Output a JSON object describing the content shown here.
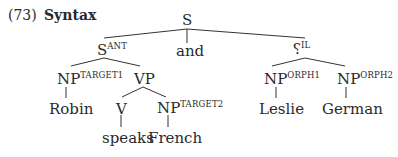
{
  "example": {
    "number": "(73)",
    "title": "Syntax"
  },
  "tree": {
    "root": {
      "label": "S",
      "sup": ""
    },
    "s_ant": {
      "label": "S",
      "sup": "ANT"
    },
    "conj": {
      "label": "and"
    },
    "il": {
      "label": "?",
      "sup": "IL"
    },
    "np_target1": {
      "label": "NP",
      "sup": "TARGET1"
    },
    "vp": {
      "label": "VP"
    },
    "v": {
      "label": "V"
    },
    "np_target2": {
      "label": "NP",
      "sup": "TARGET2"
    },
    "np_orph1": {
      "label": "NP",
      "sup": "ORPH1"
    },
    "np_orph2": {
      "label": "NP",
      "sup": "ORPH2"
    },
    "leaves": {
      "robin": "Robin",
      "speaks": "speaks",
      "french": "French",
      "leslie": "Leslie",
      "german": "German"
    }
  }
}
